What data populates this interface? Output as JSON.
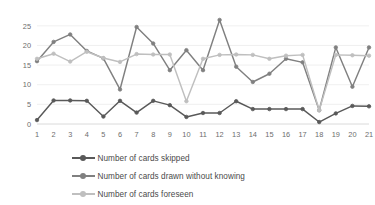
{
  "chart_data": {
    "type": "line",
    "title": "",
    "subtitle": "",
    "xlabel": "",
    "ylabel": "",
    "categories": [
      1,
      2,
      3,
      4,
      5,
      6,
      7,
      8,
      9,
      10,
      11,
      12,
      13,
      14,
      15,
      16,
      17,
      18,
      19,
      20,
      21
    ],
    "xtick_labels": [
      "1",
      "2",
      "3",
      "4",
      "5",
      "6",
      "7",
      "8",
      "9",
      "10",
      "11",
      "12",
      "13",
      "14",
      "15",
      "16",
      "17",
      "18",
      "19",
      "20",
      "21"
    ],
    "ytick_labels": [
      "0",
      "5",
      "10",
      "15",
      "20",
      "25"
    ],
    "ytick_values": [
      0,
      5,
      10,
      15,
      20,
      25
    ],
    "ylim": [
      0,
      27.5
    ],
    "xlim": [
      1,
      21
    ],
    "grid": true,
    "grid_axis": "y",
    "legend_position": "bottom",
    "series": [
      {
        "name": "Number of cards skipped",
        "color": "#595959",
        "values": [
          1.0,
          6.0,
          6.0,
          5.9,
          1.9,
          5.9,
          2.9,
          5.9,
          4.8,
          1.8,
          2.8,
          2.8,
          5.8,
          3.8,
          3.8,
          3.8,
          3.8,
          0.5,
          2.7,
          4.6,
          4.5
        ]
      },
      {
        "name": "Number of cards drawn without knowing",
        "color": "#808080",
        "values": [
          16.0,
          20.9,
          22.8,
          18.6,
          16.7,
          8.8,
          24.7,
          20.5,
          13.7,
          18.8,
          13.7,
          26.5,
          14.6,
          10.7,
          12.8,
          16.6,
          15.7,
          3.5,
          19.5,
          9.5,
          19.5
        ]
      },
      {
        "name": "Number of cards foreseen",
        "color": "#bfbfbf",
        "values": [
          16.6,
          17.9,
          15.9,
          18.4,
          16.8,
          15.8,
          17.8,
          17.7,
          17.7,
          5.8,
          16.6,
          17.6,
          17.7,
          17.6,
          16.6,
          17.4,
          17.6,
          3.5,
          17.6,
          17.5,
          17.4
        ]
      }
    ]
  },
  "legend": {
    "items": [
      {
        "label": "Number of cards skipped",
        "color": "#595959",
        "marker": "circle"
      },
      {
        "label": "Number of cards drawn without knowing",
        "color": "#808080",
        "marker": "circle"
      },
      {
        "label": "Number of cards foreseen",
        "color": "#bfbfbf",
        "marker": "circle"
      }
    ]
  }
}
